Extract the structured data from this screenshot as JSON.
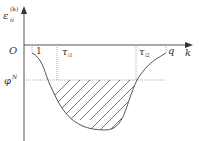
{
  "diagram": {
    "y_axis_label": "ε",
    "y_axis_label_sub": "ii",
    "y_axis_label_sup": "(k)",
    "x_axis_label": "k",
    "origin_label": "O",
    "start_label": "1",
    "end_label": "q",
    "tau1_label": "τ",
    "tau1_sub": "i1",
    "tau2_label": "τ",
    "tau2_sub": "i2",
    "threshold_label": "φ",
    "threshold_sup": "N",
    "colors": {
      "axis": "#555555",
      "curve": "#555555",
      "dotted": "#aaaaaa",
      "hatch": "#555555"
    }
  }
}
